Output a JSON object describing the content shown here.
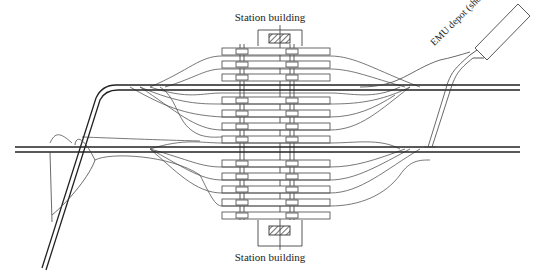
{
  "labels": {
    "station_building_top": "Station building",
    "station_building_bottom": "Station building",
    "emu_depot": "EMU depot (shed)"
  },
  "colors": {
    "line": "#222222",
    "track": "#555555",
    "platform": "#444444",
    "background": "#ffffff"
  },
  "platforms": {
    "x_start": 222,
    "x_end": 330,
    "y_positions": [
      48,
      61,
      74,
      97,
      110,
      123,
      136,
      160,
      173,
      186,
      199,
      212
    ],
    "height": 7
  },
  "main_lines": {
    "upper_y": 87,
    "lower_y": 149
  }
}
